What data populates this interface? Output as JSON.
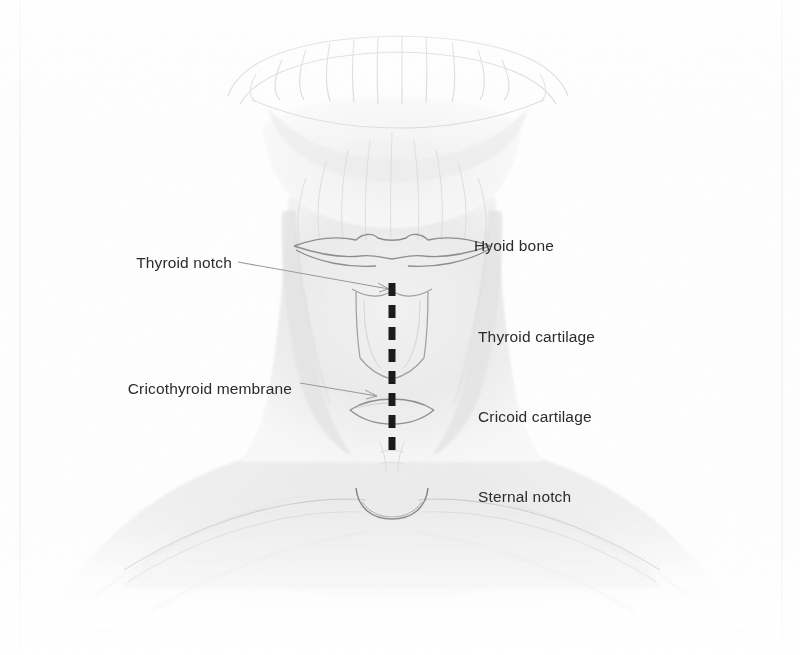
{
  "figure": {
    "domain_description": "Anatomical pencil illustration of anterior neck with surface landmarks",
    "background_color": "#fefefe",
    "ink_color": "#2b2b2b",
    "skin_shade": "#e8e8e8",
    "outline_color": "#9a9a9a",
    "dash_color": "#1a1a1a"
  },
  "labels": {
    "left": [
      {
        "id": "thyroid-notch",
        "text": "Thyroid notch",
        "x": 232,
        "y": 263,
        "leader": {
          "x1": 238,
          "y1": 262,
          "x2": 389,
          "y2": 289
        }
      },
      {
        "id": "cricothyroid-membrane",
        "text": "Cricothyroid membrane",
        "x": 292,
        "y": 389,
        "leader": {
          "x1": 300,
          "y1": 383,
          "x2": 378,
          "y2": 396
        }
      }
    ],
    "right": [
      {
        "id": "hyoid-bone",
        "text": "Hyoid bone",
        "x": 474,
        "y": 246
      },
      {
        "id": "thyroid-cartilage",
        "text": "Thyroid cartilage",
        "x": 478,
        "y": 337
      },
      {
        "id": "cricoid-cartilage",
        "text": "Cricoid cartilage",
        "x": 478,
        "y": 417
      },
      {
        "id": "sternal-notch",
        "text": "Sternal notch",
        "x": 478,
        "y": 497
      }
    ]
  },
  "midline_incision": {
    "name": "midline-dashed-marking",
    "x": 392,
    "y_start": 283,
    "y_end": 458,
    "dash_count": 8,
    "dash_length": 13,
    "dash_gap": 9,
    "width": 7,
    "color": "#1a1a1a"
  },
  "structures": {
    "hyoid_bone": {
      "cx": 392,
      "cy": 247,
      "half_width": 100,
      "height": 17
    },
    "thyroid_cartilage": {
      "cx": 392,
      "top": 289,
      "side_top": 296,
      "side_bottom": 356,
      "apex": 378,
      "half_width": 32
    },
    "cricoid_cartilage": {
      "cx": 392,
      "cy": 412,
      "half_width": 42,
      "height": 13
    },
    "sternal_notch": {
      "cx": 392,
      "cy": 496,
      "half_width": 36,
      "depth": 22
    },
    "dental_arch": {
      "cx": 398,
      "cy": 62,
      "tooth_count": 10
    }
  }
}
